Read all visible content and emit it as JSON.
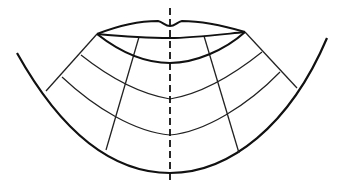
{
  "diagram": {
    "colors": {
      "stroke": "#111111",
      "background": "#ffffff"
    },
    "elements": {
      "midline": {
        "style": "dashed",
        "x": 170,
        "y1": 8,
        "y2": 183
      },
      "upper_lip": {
        "left_corner": [
          97,
          34
        ],
        "right_corner": [
          245,
          32
        ],
        "cupid_bow_dip": [
          170,
          26
        ]
      },
      "lower_lip": {
        "lowest_point": [
          170,
          63
        ]
      },
      "outer_curve": {
        "left_end": [
          17,
          53
        ],
        "bottom": [
          170,
          173
        ],
        "right_end": [
          327,
          38
        ]
      },
      "arcs": [
        {
          "left": [
            81,
            55
          ],
          "center": [
            170,
            99
          ],
          "right": [
            262,
            52
          ]
        },
        {
          "left": [
            62,
            77
          ],
          "center": [
            170,
            135
          ],
          "right": [
            280,
            72
          ]
        }
      ],
      "radial_lines": [
        {
          "from": [
            97,
            34
          ],
          "to": [
            46,
            91
          ]
        },
        {
          "from": [
            139,
            37
          ],
          "to": [
            106,
            150
          ]
        },
        {
          "from": [
            204,
            36
          ],
          "to": [
            239,
            153
          ]
        },
        {
          "from": [
            245,
            32
          ],
          "to": [
            297,
            88
          ]
        }
      ]
    }
  }
}
